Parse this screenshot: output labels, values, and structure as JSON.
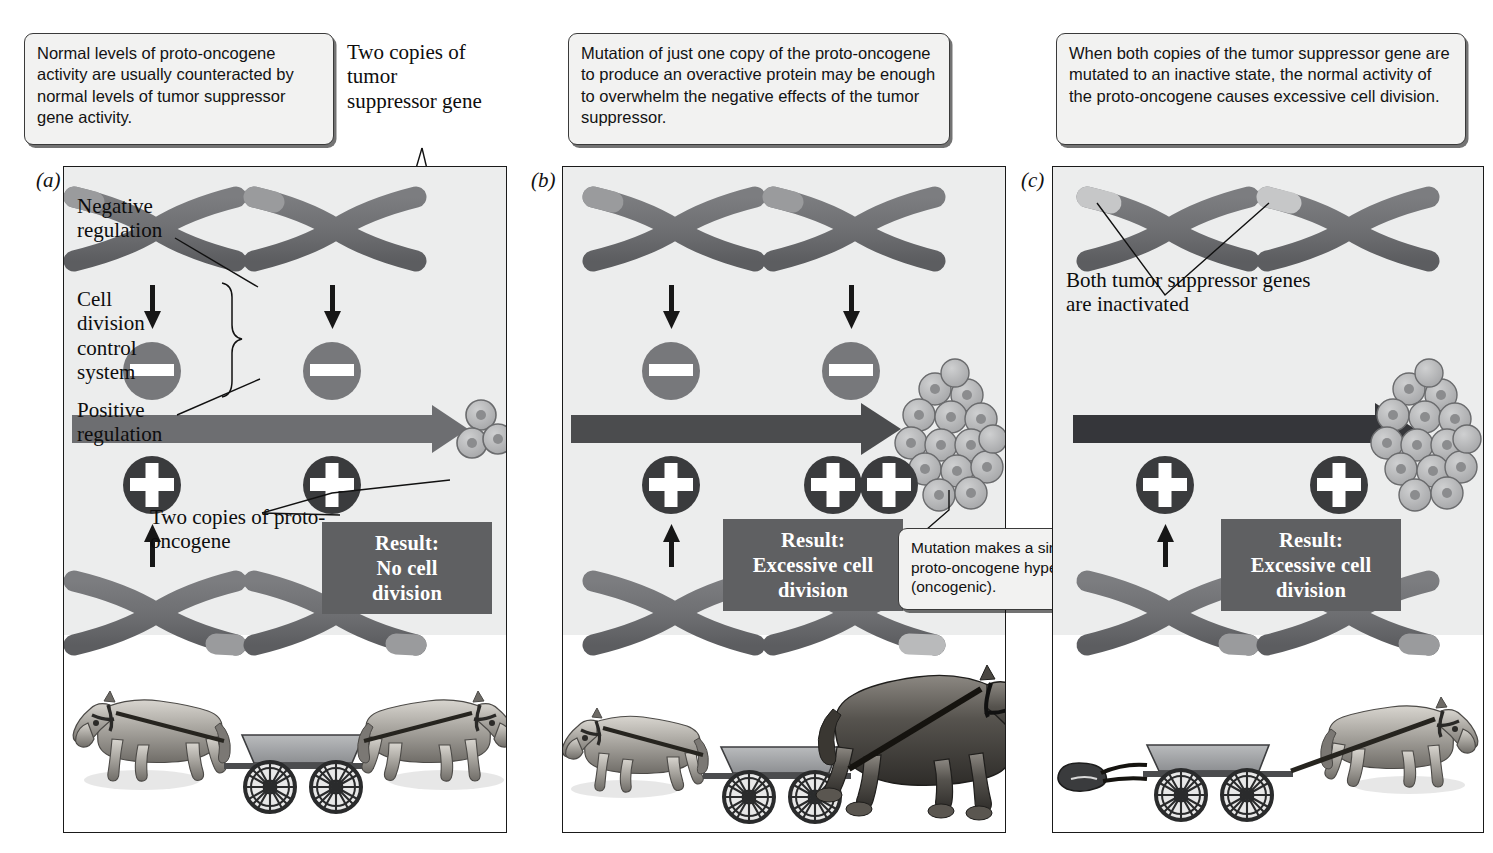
{
  "figure": {
    "panels": [
      "(a)",
      "(b)",
      "(c)"
    ]
  },
  "colors": {
    "chromosome_body": "#6d6e71",
    "chromosome_tip_normal": "#9a9b9d",
    "chromosome_tip_mutated": "#b9babb",
    "arrow": "#6d6e71",
    "arrow_dark": "#4b4c4e",
    "symbol_minus": "#77787b",
    "symbol_plus": "#3a3b3d",
    "result_bg": "#5f6062",
    "panel_top_bg": "#eceded",
    "callout_bg": "#f2f2f1",
    "cell_fill": "#b6b7b9"
  },
  "callouts": {
    "a": "Normal levels of proto-oncogene activity are usually counteracted by normal levels of tumor suppressor gene activity.",
    "b": "Mutation of just one copy of the proto-oncogene to produce an overactive protein may be enough to overwhelm the negative effects of the tumor suppressor.",
    "c": "When both copies of the tumor suppressor gene are mutated to an inactive state, the normal activity of the proto-oncogene causes excessive cell division.",
    "b_mutation": "Mutation makes a single proto-oncogene hyperactive (oncogenic)."
  },
  "labels": {
    "two_copies_tumor_suppressor": "Two copies of tumor suppressor gene",
    "negative_regulation": "Negative regulation",
    "cell_division_control_system": "Cell division control system",
    "positive_regulation": "Positive regulation",
    "two_copies_proto_oncogene": "Two copies of proto-oncogene",
    "both_inactivated": "Both tumor suppressor genes are inactivated"
  },
  "results": {
    "a": {
      "heading": "Result:",
      "line1": "No cell",
      "line2": "division"
    },
    "b": {
      "heading": "Result:",
      "line1": "Excessive cell",
      "line2": "division"
    },
    "c": {
      "heading": "Result:",
      "line1": "Excessive cell",
      "line2": "division"
    }
  },
  "symbols": {
    "minus": "minus-regulation-symbol",
    "plus": "plus-regulation-symbol"
  },
  "panel_state": {
    "a": {
      "letter": "(a)",
      "top_chromosomes": 2,
      "top_tips_active": 2,
      "minus_symbols": 2,
      "plus_symbols": 2,
      "bottom_tips_mutated": 0,
      "outcome_cells": "small-cluster",
      "horses": "two-balanced-horses"
    },
    "b": {
      "letter": "(b)",
      "top_chromosomes": 2,
      "top_tips_active": 2,
      "minus_symbols": 2,
      "plus_symbols": 3,
      "bottom_tips_mutated": 1,
      "outcome_cells": "tumor-mass",
      "horses": "small-horse-and-large-draft-horse"
    },
    "c": {
      "letter": "(c)",
      "top_chromosomes": 2,
      "top_tips_active": 0,
      "minus_symbols": 0,
      "plus_symbols": 2,
      "bottom_tips_mutated": 0,
      "outcome_cells": "tumor-mass",
      "horses": "one-horse-with-empty-harness"
    }
  }
}
